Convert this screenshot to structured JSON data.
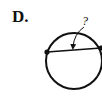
{
  "figure": {
    "option_label": "D.",
    "question_mark": "?",
    "stroke_color": "#111111",
    "circle": {
      "cx": 74,
      "cy": 61,
      "r": 28
    },
    "chord": {
      "x1": 47,
      "y1": 52,
      "x2": 101,
      "y2": 48
    },
    "arrow": {
      "from": [
        86,
        27
      ],
      "to": [
        73,
        49
      ]
    },
    "question_pos": [
      84,
      24
    ]
  }
}
